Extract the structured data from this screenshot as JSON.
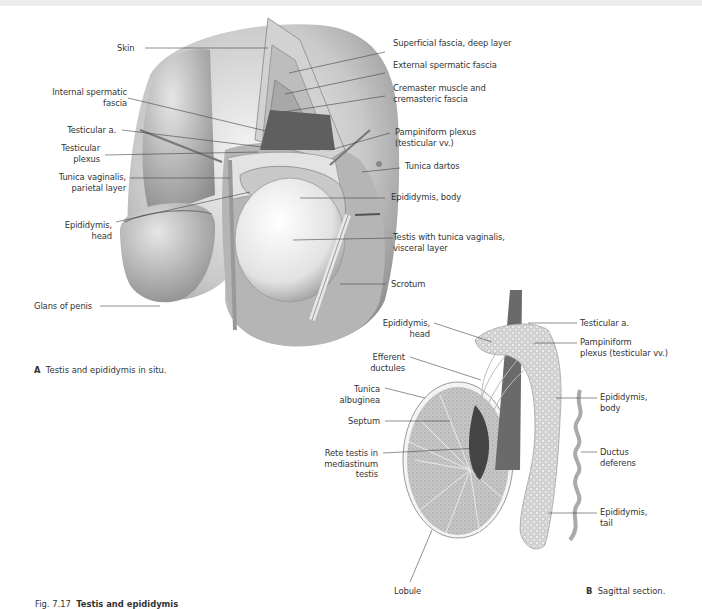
{
  "figure": {
    "number": "Fig. 7.17",
    "title": "Testis and epididymis",
    "subtitle": "Left lateral view."
  },
  "panel_a": {
    "letter": "A",
    "caption": "Testis and epididymis in situ.",
    "labels_left": {
      "skin": "Skin",
      "internal_spermatic_fascia_1": "Internal spermatic",
      "internal_spermatic_fascia_2": "fascia",
      "testicular_a": "Testicular a.",
      "testicular_plexus_1": "Testicular",
      "testicular_plexus_2": "plexus",
      "tunica_vaginalis_1": "Tunica vaginalis,",
      "tunica_vaginalis_2": "parietal layer",
      "epididymis_head_1": "Epididymis,",
      "epididymis_head_2": "head",
      "glans": "Glans of penis"
    },
    "labels_right": {
      "superficial_fascia": "Superficial fascia, deep layer",
      "external_spermatic_fascia": "External spermatic fascia",
      "cremaster_1": "Cremaster muscle and",
      "cremaster_2": "cremasteric fascia",
      "pampiniform_1": "Pampiniform plexus",
      "pampiniform_2": "(testicular vv.)",
      "tunica_dartos": "Tunica dartos",
      "epididymis_body": "Epididymis, body",
      "testis_1": "Testis with tunica vaginalis,",
      "testis_2": "visceral layer",
      "scrotum": "Scrotum"
    }
  },
  "panel_b": {
    "letter": "B",
    "caption": "Sagittal section.",
    "labels_left": {
      "epididymis_head_1": "Epididymis,",
      "epididymis_head_2": "head",
      "efferent_1": "Efferent",
      "efferent_2": "ductules",
      "tunica_albuginea_1": "Tunica",
      "tunica_albuginea_2": "albuginea",
      "septum": "Septum",
      "rete_1": "Rete testis in",
      "rete_2": "mediastinum",
      "rete_3": "testis",
      "lobule": "Lobule"
    },
    "labels_right": {
      "testicular_a": "Testicular a.",
      "pampiniform_1": "Pampiniform",
      "pampiniform_2": "plexus (testicular vv.)",
      "epididymis_body_1": "Epididymis,",
      "epididymis_body_2": "body",
      "ductus_1": "Ductus",
      "ductus_2": "deferens",
      "epididymis_tail_1": "Epididymis,",
      "epididymis_tail_2": "tail"
    }
  }
}
